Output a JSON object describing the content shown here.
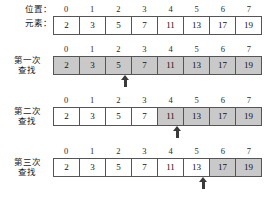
{
  "header": {
    "position_label": "位置：",
    "element_label": "元素："
  },
  "indices": [
    "0",
    "1",
    "2",
    "3",
    "4",
    "5",
    "6",
    "7"
  ],
  "elements": [
    "2",
    "3",
    "5",
    "7",
    "11",
    "13",
    "17",
    "19"
  ],
  "colors": {
    "shaded_cell": "#c9c9c9",
    "cell_border": "#555555",
    "arrow": "#3a3a3a",
    "background": "#ffffff"
  },
  "rows": [
    {
      "label_line1": "",
      "label_line2": "",
      "shaded": [
        false,
        false,
        false,
        false,
        false,
        false,
        false,
        false
      ],
      "arrow_index": null
    },
    {
      "label_line1": "第一次",
      "label_line2": "查找",
      "shaded": [
        true,
        true,
        true,
        true,
        true,
        true,
        true,
        true
      ],
      "arrow_index": 3
    },
    {
      "label_line1": "第二次",
      "label_line2": "查找",
      "shaded": [
        false,
        false,
        false,
        false,
        true,
        true,
        true,
        true
      ],
      "arrow_index": 5
    },
    {
      "label_line1": "第三次",
      "label_line2": "查找",
      "shaded": [
        false,
        false,
        false,
        false,
        false,
        false,
        true,
        true
      ],
      "arrow_index": 6
    }
  ]
}
